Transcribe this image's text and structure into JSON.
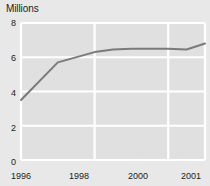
{
  "chart_data": {
    "type": "line",
    "title": "Millions",
    "subtitle": "",
    "xlabel": "",
    "ylabel": "",
    "ylim": [
      0,
      8
    ],
    "xlim": [
      1996,
      2001
    ],
    "yticks": [
      8,
      6,
      4,
      2,
      0
    ],
    "ytick_labels": [
      "8",
      "6",
      "4",
      "2",
      "0"
    ],
    "xticks": [
      1996,
      1998,
      2000,
      2001
    ],
    "xtick_labels": [
      "1996",
      "1998",
      "2000",
      "2001"
    ],
    "grid": true,
    "grid_color": "#ffffff",
    "plot_background": "#e0e0e0",
    "line_color": "#7a7a7a",
    "line_width": 2,
    "legend": null,
    "x": [
      1996,
      1997,
      1998,
      1998.5,
      1999,
      2000,
      2000.5,
      2001
    ],
    "values": [
      3.5,
      5.7,
      6.3,
      6.45,
      6.5,
      6.5,
      6.45,
      6.8
    ],
    "series": [
      {
        "name": "",
        "values": [
          3.5,
          5.7,
          6.3,
          6.45,
          6.5,
          6.5,
          6.45,
          6.8
        ]
      }
    ]
  },
  "labels": {
    "title": "Millions",
    "y0": "0",
    "y1": "2",
    "y2": "4",
    "y3": "6",
    "y4": "8",
    "x0": "1996",
    "x1": "1998",
    "x2": "2000",
    "x3": "2001"
  }
}
